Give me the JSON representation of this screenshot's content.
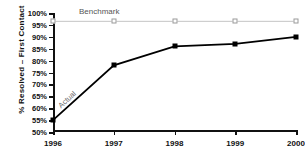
{
  "chart_data": {
    "type": "line",
    "title": "",
    "xlabel": "",
    "ylabel": "% Resolved – First Contact",
    "categories": [
      "1996",
      "1997",
      "1998",
      "1999",
      "2000"
    ],
    "ylim": [
      50,
      100
    ],
    "ytick_labels": [
      "50%",
      "55%",
      "60%",
      "65%",
      "70%",
      "75%",
      "80%",
      "85%",
      "90%",
      "95%",
      "100%"
    ],
    "ytick_values": [
      50,
      55,
      60,
      65,
      70,
      75,
      80,
      85,
      90,
      95,
      100
    ],
    "grid": false,
    "legend_position": "inline-annotation",
    "series": [
      {
        "name": "Benchmark",
        "values": [
          96.5,
          96.5,
          96.5,
          96.5,
          96.5
        ],
        "color": "#bdbdbd",
        "marker": "open-square",
        "marker_color": "#9a9a9a"
      },
      {
        "name": "Actual",
        "values": [
          55,
          78,
          86,
          87,
          90
        ],
        "color": "#000000",
        "marker": "filled-square",
        "marker_color": "#000000"
      }
    ],
    "annotations": [
      {
        "text": "Benchmark",
        "series": "Benchmark"
      },
      {
        "text": "Actual",
        "series": "Actual"
      }
    ]
  }
}
